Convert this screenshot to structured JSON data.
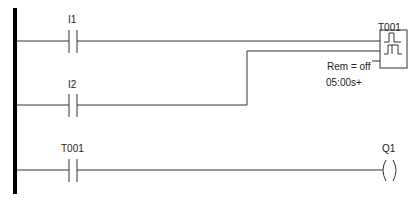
{
  "diagram": {
    "type": "ladder-logic",
    "rungs": [
      {
        "contacts": [
          {
            "label": "I1",
            "type": "normally-open"
          }
        ],
        "output": {
          "label": "T001",
          "type": "timer-block",
          "connection": "trigger"
        }
      },
      {
        "contacts": [
          {
            "label": "I2",
            "type": "normally-open"
          }
        ],
        "output": {
          "label": "T001",
          "type": "timer-block",
          "connection": "reset"
        }
      },
      {
        "contacts": [
          {
            "label": "T001",
            "type": "normally-open"
          }
        ],
        "output": {
          "label": "Q1",
          "type": "coil"
        }
      }
    ],
    "timer": {
      "label": "T001",
      "remanence": "Rem = off",
      "time": "05:00s+"
    },
    "labels": {
      "contact1": "I1",
      "contact2": "I2",
      "contact3": "T001",
      "coil": "Q1"
    },
    "colors": {
      "line": "#333333",
      "rail": "#000000",
      "background": "#ffffff"
    }
  }
}
